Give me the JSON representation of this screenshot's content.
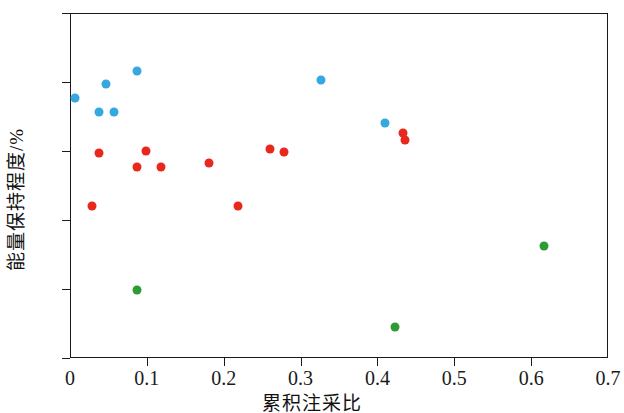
{
  "chart_data": {
    "type": "scatter",
    "title": "",
    "xlabel": "累积注采比",
    "ylabel": "能量保持程度/%",
    "xlim": [
      0,
      0.7
    ],
    "ylim": [
      75,
      100
    ],
    "xticks": [
      "0",
      "0.1",
      "0.2",
      "0.3",
      "0.4",
      "0.5",
      "0.6",
      "0.7"
    ],
    "xtick_values": [
      0,
      0.1,
      0.2,
      0.3,
      0.4,
      0.5,
      0.6,
      0.7
    ],
    "yticks": [
      "75",
      "80",
      "85",
      "90",
      "95",
      "100"
    ],
    "ytick_values": [
      75,
      80,
      85,
      90,
      95,
      100
    ],
    "grid": false,
    "legend": null,
    "colors": {
      "blue": "#35a8e0",
      "red": "#e8281c",
      "green": "#2e9b35",
      "axis": "#1a1a1a",
      "background": "#ffffff"
    },
    "series": [
      {
        "name": "blue-group",
        "color": "#35a8e0",
        "points": [
          {
            "x": 0.005,
            "y": 93.9
          },
          {
            "x": 0.037,
            "y": 92.9
          },
          {
            "x": 0.046,
            "y": 94.9
          },
          {
            "x": 0.056,
            "y": 92.9
          },
          {
            "x": 0.086,
            "y": 95.9
          },
          {
            "x": 0.325,
            "y": 95.2
          },
          {
            "x": 0.409,
            "y": 92.1
          }
        ]
      },
      {
        "name": "red-group",
        "color": "#e8281c",
        "points": [
          {
            "x": 0.027,
            "y": 86.1
          },
          {
            "x": 0.037,
            "y": 89.9
          },
          {
            "x": 0.086,
            "y": 88.9
          },
          {
            "x": 0.097,
            "y": 90.1
          },
          {
            "x": 0.117,
            "y": 88.9
          },
          {
            "x": 0.179,
            "y": 89.2
          },
          {
            "x": 0.217,
            "y": 86.1
          },
          {
            "x": 0.259,
            "y": 90.2
          },
          {
            "x": 0.277,
            "y": 90.0
          },
          {
            "x": 0.432,
            "y": 91.4
          },
          {
            "x": 0.435,
            "y": 90.9
          }
        ]
      },
      {
        "name": "green-group",
        "color": "#2e9b35",
        "points": [
          {
            "x": 0.086,
            "y": 80.0
          },
          {
            "x": 0.422,
            "y": 77.3
          },
          {
            "x": 0.616,
            "y": 83.2
          }
        ]
      }
    ]
  }
}
